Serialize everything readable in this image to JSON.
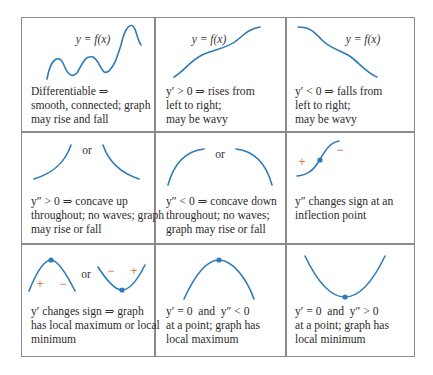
{
  "figure": {
    "type": "curve-shape-reference-table",
    "rows": 3,
    "columns": 3,
    "colors": {
      "curve": "#2e7bb8",
      "sign_marks": "#e07850",
      "grid": "#8a8a8a",
      "text": "#2b2b2b"
    },
    "cells": [
      {
        "label": "y = f(x)",
        "caption": [
          "Differentiable ⇒",
          "smooth, connected; graph",
          "may rise and fall"
        ]
      },
      {
        "label": "y = f(x)",
        "caption": [
          "y′ > 0 ⇒ rises from",
          "left to right;",
          "may be wavy"
        ]
      },
      {
        "label": "y = f(x)",
        "caption": [
          "y′ < 0 ⇒ falls from",
          "left to right;",
          "may be wavy"
        ]
      },
      {
        "connector": "or",
        "caption": [
          "y″ > 0 ⇒ concave up",
          "throughout; no waves; graph",
          "may rise or fall"
        ]
      },
      {
        "connector": "or",
        "caption": [
          "y″ < 0 ⇒ concave down",
          "throughout; no waves;",
          "graph may rise or fall"
        ]
      },
      {
        "signs": [
          "+",
          "−"
        ],
        "caption": [
          "y″ changes sign at an",
          "inflection point"
        ]
      },
      {
        "connector": "or",
        "signs_left": [
          "+",
          "−"
        ],
        "signs_right": [
          "−",
          "+"
        ],
        "caption": [
          "y′ changes sign ⇒ graph",
          "has local maximum or local",
          "minimum"
        ]
      },
      {
        "caption": [
          "y′ = 0  and  y″ < 0",
          "at a point; graph has",
          "local maximum"
        ]
      },
      {
        "caption": [
          "y′ = 0  and  y″ > 0",
          "at a point; graph has",
          "local minimum"
        ]
      }
    ]
  }
}
